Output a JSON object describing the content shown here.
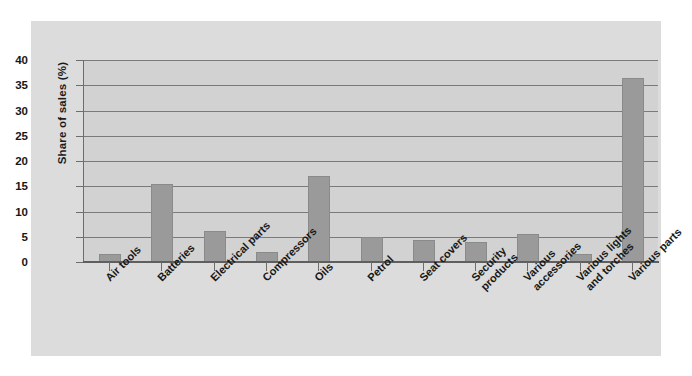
{
  "chart_data": {
    "type": "bar",
    "title": "",
    "xlabel": "",
    "ylabel": "Share of sales (%)",
    "ylim": [
      0,
      40
    ],
    "ytick_step": 5,
    "yticks": [
      40,
      35,
      30,
      25,
      20,
      15,
      10,
      5,
      0
    ],
    "grid": true,
    "legend": "none",
    "categories": [
      "Air tools",
      "Batteries",
      "Electrical parts",
      "Compressors",
      "Oils",
      "Petrol",
      "Seat covers",
      "Security products",
      "Various accessories",
      "Various lights and torches",
      "Various parts"
    ],
    "category_lines": [
      [
        "Air tools"
      ],
      [
        "Batteries"
      ],
      [
        "Electrical parts"
      ],
      [
        "Compressors"
      ],
      [
        "Oils"
      ],
      [
        "Petrol"
      ],
      [
        "Seat covers"
      ],
      [
        "Security",
        "products"
      ],
      [
        "Various",
        "accessories"
      ],
      [
        "Various lights",
        "and torches"
      ],
      [
        "Various parts"
      ]
    ],
    "values": [
      1.5,
      15.5,
      6.1,
      2.0,
      17.0,
      5.0,
      4.3,
      4.0,
      5.6,
      1.5,
      36.5
    ],
    "colors": {
      "bar_fill": "#9a9a9a",
      "bar_border": "#8a8a8a",
      "plot_background": "#d2d2d2",
      "figure_background": "#dcdcdc",
      "gridline": "#7a7a7a",
      "axis": "#6d6d6d",
      "text": "#171717"
    }
  }
}
